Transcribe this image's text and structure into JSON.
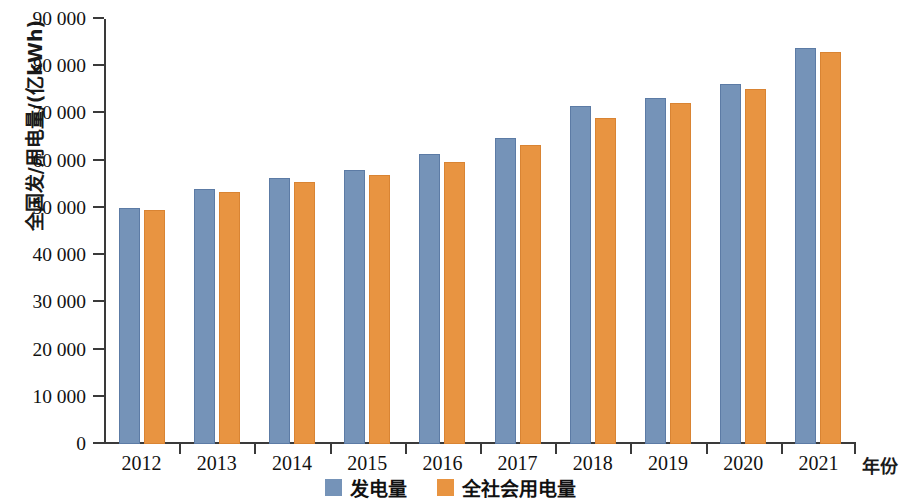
{
  "chart_data": {
    "type": "bar",
    "title": "",
    "xlabel": "年份",
    "ylabel": "全国发/用电量/(亿kWh)",
    "categories": [
      "2012",
      "2013",
      "2014",
      "2015",
      "2016",
      "2017",
      "2018",
      "2019",
      "2020",
      "2021"
    ],
    "series": [
      {
        "name": "发电量",
        "color": "#7593b8",
        "values": [
          50000,
          53900,
          56300,
          58000,
          61400,
          64800,
          71600,
          73300,
          76200,
          83800
        ]
      },
      {
        "name": "全社会用电量",
        "color": "#e89441",
        "values": [
          49600,
          53300,
          55500,
          56900,
          59700,
          63300,
          69000,
          72300,
          75200,
          83100
        ]
      }
    ],
    "ylim": [
      0,
      90000
    ],
    "ytick_values": [
      0,
      10000,
      20000,
      30000,
      40000,
      50000,
      60000,
      70000,
      80000,
      90000
    ],
    "ytick_labels": [
      "0",
      "10 000",
      "20 000",
      "30 000",
      "40 000",
      "50 000",
      "60 000",
      "70 000",
      "80 000",
      "90 000"
    ],
    "grid": false,
    "legend_position": "bottom-center"
  }
}
